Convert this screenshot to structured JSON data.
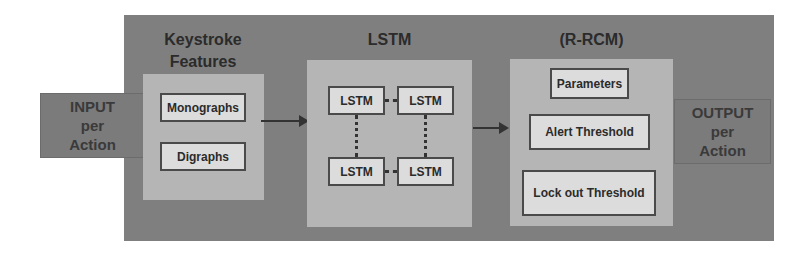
{
  "input": {
    "lines": [
      "INPUT",
      "per",
      "Action"
    ]
  },
  "output": {
    "lines": [
      "OUTPUT",
      "per",
      "Action"
    ]
  },
  "keystroke": {
    "title_lines": [
      "Keystroke",
      "Features"
    ],
    "items": [
      "Monographs",
      "Digraphs"
    ]
  },
  "lstm": {
    "title": "LSTM",
    "cells": [
      "LSTM",
      "LSTM",
      "LSTM",
      "LSTM"
    ]
  },
  "rrcm": {
    "title": "(R-RCM)",
    "items": [
      "Parameters",
      "Alert Threshold",
      "Lock out Threshold"
    ]
  },
  "colors": {
    "outer": "#7f7f7f",
    "panel": "#b5b5b5",
    "box": "#dcdcdc",
    "border": "#4a4a4a"
  }
}
